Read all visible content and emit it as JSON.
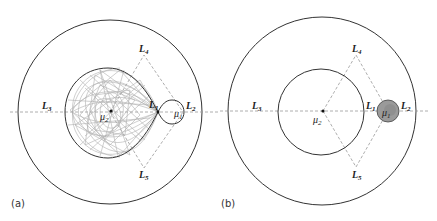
{
  "figure": {
    "panels": [
      {
        "tag": "(a)",
        "outer_circle": {
          "cx": 110,
          "cy": 112,
          "r": 92
        },
        "inner_lobe": {
          "left": 65,
          "top": 68,
          "bottom": 158,
          "cusp_x": 158
        },
        "small_lobe": {
          "cx": 170,
          "cy": 112,
          "r": 12
        },
        "trajectory_color": "#a8a8a8",
        "labels": {
          "L1": "L",
          "L1_sub": "1",
          "L2": "L",
          "L2_sub": "2",
          "L3": "L",
          "L3_sub": "3",
          "L4": "L",
          "L4_sub": "4",
          "L5": "L",
          "L5_sub": "5",
          "mu1": "μ",
          "mu1_sub": "1",
          "mu2": "μ",
          "mu2_sub": "2"
        }
      },
      {
        "tag": "(b)",
        "outer_circle": {
          "cx": 322,
          "cy": 111,
          "r": 94
        },
        "inner_circle": {
          "cx": 321,
          "cy": 112,
          "r": 43
        },
        "mu1_blob": {
          "cx": 388,
          "cy": 111,
          "r": 11,
          "fill": "#9a9a9a"
        },
        "labels": {
          "L1": "L",
          "L1_sub": "1",
          "L2": "L",
          "L2_sub": "2",
          "L3": "L",
          "L3_sub": "3",
          "L4": "L",
          "L4_sub": "4",
          "L5": "L",
          "L5_sub": "5",
          "mu1": "μ",
          "mu1_sub": "1",
          "mu2": "μ",
          "mu2_sub": "2"
        }
      }
    ],
    "colors": {
      "line": "#333333",
      "dashed": "#999999"
    }
  }
}
